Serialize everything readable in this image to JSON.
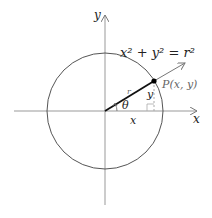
{
  "diagram": {
    "equation": "x² + y² = r²",
    "labels": {
      "x_axis": "x",
      "y_axis": "y",
      "point": "P(x, y)",
      "radius": "r",
      "angle": "θ",
      "horizontal_leg": "x",
      "vertical_leg": "y"
    },
    "colors": {
      "axis": "#888888",
      "circle": "#555555",
      "radius_segment": "#111111",
      "ray": "#666666",
      "point": "#000000",
      "dashed_leg": "#aaaaaa"
    }
  }
}
